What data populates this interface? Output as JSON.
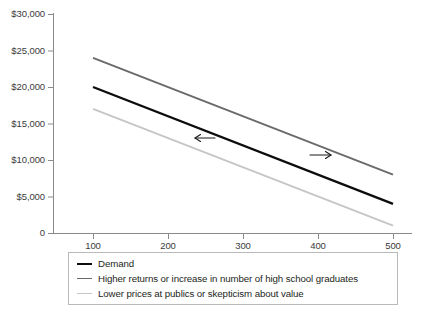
{
  "chart_data": {
    "type": "line",
    "title": "",
    "subtitle": "",
    "xlabel": "",
    "ylabel": "",
    "x": [
      100,
      500
    ],
    "xlim": [
      50,
      520
    ],
    "ylim": [
      0,
      30000
    ],
    "grid": false,
    "legend_position": "bottom",
    "x_ticks": [
      {
        "value": 100,
        "label": "100"
      },
      {
        "value": 200,
        "label": "200"
      },
      {
        "value": 300,
        "label": "300"
      },
      {
        "value": 400,
        "label": "400"
      },
      {
        "value": 500,
        "label": "500"
      }
    ],
    "y_ticks": [
      {
        "value": 30000,
        "label": "$30,000"
      },
      {
        "value": 25000,
        "label": "$25,000"
      },
      {
        "value": 20000,
        "label": "$20,000"
      },
      {
        "value": 15000,
        "label": "$15,000"
      },
      {
        "value": 10000,
        "label": "$10,000"
      },
      {
        "value": 5000,
        "label": "$5,000"
      },
      {
        "value": 0,
        "label": "0"
      }
    ],
    "series": [
      {
        "name": "Demand",
        "color": "#0d0d0d",
        "width": 2.4,
        "values": [
          20000,
          4000
        ]
      },
      {
        "name": "Higher returns or  increase in number of high school graduates",
        "color": "#6a6a6a",
        "width": 1.9,
        "values": [
          24000,
          8000
        ]
      },
      {
        "name": "Lower prices at publics or skepticism about value",
        "color": "#c6c6c6",
        "width": 1.9,
        "values": [
          17000,
          1000
        ]
      }
    ],
    "annotations": [
      {
        "type": "arrow",
        "direction": "left",
        "x_from": 215,
        "y_from": 138,
        "x_to": 195,
        "y_to": 138,
        "color": "#1a1a1a"
      },
      {
        "type": "arrow",
        "direction": "right",
        "x_from": 310,
        "y_from": 155,
        "x_to": 331,
        "y_to": 155,
        "color": "#1a1a1a"
      }
    ]
  },
  "axes": {
    "axis_color": "#8a8a8a",
    "tick_color": "#8a8a8a"
  },
  "legend": {
    "border_color": "#b9b9b9",
    "entries": [
      {
        "label": "Demand",
        "color": "#0d0d0d",
        "thickness": "2.4px"
      },
      {
        "label": "Higher returns or  increase in number of high school graduates",
        "color": "#6a6a6a",
        "thickness": "1.9px"
      },
      {
        "label": "Lower prices at publics or skepticism about value",
        "color": "#c6c6c6",
        "thickness": "1.9px"
      }
    ]
  }
}
